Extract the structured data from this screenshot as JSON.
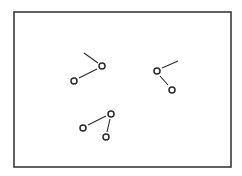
{
  "diagram": {
    "frame": {
      "x": 14,
      "y": 12,
      "width": 217,
      "height": 155,
      "stroke": "#3a3a3a"
    },
    "stroke_color": "#2a2a2a",
    "clusters": [
      {
        "name": "cluster-top-left",
        "atoms": [
          {
            "x": 102,
            "y": 66
          },
          {
            "x": 74,
            "y": 81
          }
        ],
        "bonds": [
          {
            "x1": 84,
            "y1": 53,
            "x2": 98,
            "y2": 63
          },
          {
            "x1": 79,
            "y1": 78,
            "x2": 97,
            "y2": 69
          }
        ]
      },
      {
        "name": "cluster-right",
        "atoms": [
          {
            "x": 157,
            "y": 71
          },
          {
            "x": 172,
            "y": 90
          }
        ],
        "bonds": [
          {
            "x1": 162,
            "y1": 68,
            "x2": 178,
            "y2": 61
          },
          {
            "x1": 160,
            "y1": 76,
            "x2": 168,
            "y2": 85
          }
        ]
      },
      {
        "name": "cluster-bottom",
        "atoms": [
          {
            "x": 111,
            "y": 114
          },
          {
            "x": 83,
            "y": 128
          },
          {
            "x": 106,
            "y": 137
          }
        ],
        "bonds": [
          {
            "x1": 88,
            "y1": 125,
            "x2": 106,
            "y2": 116
          },
          {
            "x1": 110,
            "y1": 119,
            "x2": 107,
            "y2": 132
          }
        ]
      }
    ]
  }
}
